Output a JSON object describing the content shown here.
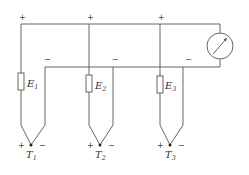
{
  "diagram": {
    "colors": {
      "line": "#555555",
      "text": "#333333",
      "background": "#ffffff"
    },
    "meter": {
      "icon": "galvanometer-icon",
      "cx": 220,
      "cy": 46,
      "r": 13
    },
    "thermocouples": [
      {
        "emf_label": "E",
        "emf_sub": "1",
        "junction_label": "T",
        "junction_sub": "1",
        "plus": "+",
        "minus": "−",
        "top_plus": "+",
        "top_minus": "−"
      },
      {
        "emf_label": "E",
        "emf_sub": "2",
        "junction_label": "T",
        "junction_sub": "2",
        "plus": "+",
        "minus": "−",
        "top_plus": "+",
        "top_minus": "−"
      },
      {
        "emf_label": "E",
        "emf_sub": "3",
        "junction_label": "T",
        "junction_sub": "3",
        "plus": "+",
        "minus": "−",
        "top_plus": "+",
        "top_minus": "−"
      }
    ]
  }
}
